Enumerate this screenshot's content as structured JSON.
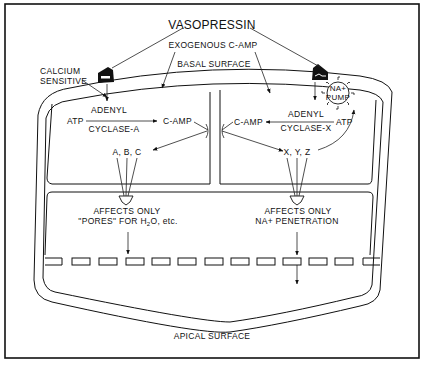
{
  "diagram": {
    "title": "VASOPRESSIN",
    "labels": {
      "exogenous": "EXOGENOUS C-AMP",
      "basal": "BASAL SURFACE",
      "calcium_line1": "CALCIUM",
      "calcium_line2": "SENSITIVE",
      "apical": "APICAL SURFACE"
    },
    "left_cell": {
      "substrate": "ATP",
      "enzyme_line1": "ADENYL",
      "enzyme_line2": "CYCLASE-A",
      "product": "C-AMP",
      "targets": "A, B, C",
      "effect_line1": "AFFECTS ONLY",
      "effect_line2_pre": "\"PORES\" FOR H",
      "effect_line2_sub": "2",
      "effect_line2_post": "O, etc."
    },
    "right_cell": {
      "substrate": "ATP",
      "enzyme_line1": "ADENYL",
      "enzyme_line2": "CYCLASE-X",
      "product": "C-AMP",
      "targets": "X, Y, Z",
      "pump_line1": "NA+",
      "pump_line2": "PUMP",
      "effect_line1": "AFFECTS ONLY",
      "effect_line2": "NA+ PENETRATION"
    },
    "colors": {
      "ink": "#111111",
      "paper": "#ffffff"
    }
  }
}
